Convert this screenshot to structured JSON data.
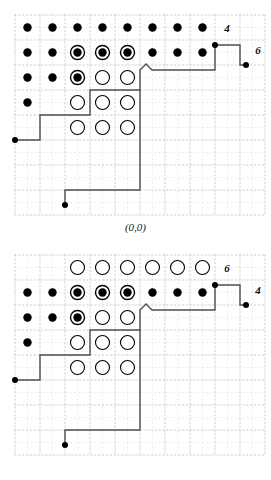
{
  "figures": [
    {
      "id": "figure-top",
      "caption": "(0,0)",
      "vertical_label": "4",
      "horizontal_label": "6",
      "grid": {
        "cols": 10,
        "rows": 8,
        "cell": 25,
        "origin_x": 15,
        "origin_y": 15,
        "minor_step": 12.5,
        "minor_color": "#d9d9e6",
        "major_color": "#c9c9d6"
      },
      "particles": [
        {
          "row": 0,
          "col": 0,
          "type": "filled"
        },
        {
          "row": 0,
          "col": 1,
          "type": "filled"
        },
        {
          "row": 0,
          "col": 2,
          "type": "filled"
        },
        {
          "row": 0,
          "col": 3,
          "type": "filled"
        },
        {
          "row": 0,
          "col": 4,
          "type": "filled"
        },
        {
          "row": 0,
          "col": 5,
          "type": "filled"
        },
        {
          "row": 0,
          "col": 6,
          "type": "filled"
        },
        {
          "row": 0,
          "col": 7,
          "type": "filled"
        },
        {
          "row": 1,
          "col": 0,
          "type": "filled"
        },
        {
          "row": 1,
          "col": 1,
          "type": "filled"
        },
        {
          "row": 1,
          "col": 2,
          "type": "ringed"
        },
        {
          "row": 1,
          "col": 3,
          "type": "ringed"
        },
        {
          "row": 1,
          "col": 4,
          "type": "ringed"
        },
        {
          "row": 1,
          "col": 5,
          "type": "filled"
        },
        {
          "row": 1,
          "col": 6,
          "type": "filled"
        },
        {
          "row": 1,
          "col": 7,
          "type": "filled"
        },
        {
          "row": 2,
          "col": 0,
          "type": "filled"
        },
        {
          "row": 2,
          "col": 1,
          "type": "filled"
        },
        {
          "row": 2,
          "col": 2,
          "type": "ringed"
        },
        {
          "row": 2,
          "col": 3,
          "type": "open"
        },
        {
          "row": 2,
          "col": 4,
          "type": "open"
        },
        {
          "row": 3,
          "col": 0,
          "type": "filled"
        },
        {
          "row": 3,
          "col": 2,
          "type": "open"
        },
        {
          "row": 3,
          "col": 3,
          "type": "open"
        },
        {
          "row": 3,
          "col": 4,
          "type": "open"
        },
        {
          "row": 4,
          "col": 2,
          "type": "open"
        },
        {
          "row": 4,
          "col": 3,
          "type": "open"
        },
        {
          "row": 4,
          "col": 4,
          "type": "open"
        }
      ],
      "path": "M 15,140 L 40,140 L 40,115 L 90,115 L 90,90 L 140,90 L 140,70 L 146,64 L 152,70 L 215,70 L 215,45 L 240,45 L 240,65 L 246,65",
      "path_points": [
        {
          "x": 15,
          "y": 140,
          "marker": "dot"
        },
        {
          "x": 215,
          "y": 45,
          "marker": "none"
        },
        {
          "x": 246,
          "y": 65,
          "marker": "dot"
        }
      ],
      "path_lower": "M 140,90 L 140,190 L 65,190 L 65,205",
      "endpoints": [
        {
          "x": 15,
          "y": 140
        },
        {
          "x": 65,
          "y": 205
        },
        {
          "x": 215,
          "y": 45
        },
        {
          "x": 246,
          "y": 65
        }
      ],
      "label_positions": {
        "vertical": {
          "x": 227,
          "y": 32
        },
        "horizontal": {
          "x": 258,
          "y": 54
        }
      }
    },
    {
      "id": "figure-bottom",
      "caption": "(0,0)",
      "vertical_label": "6",
      "horizontal_label": "4",
      "grid": {
        "cols": 10,
        "rows": 8,
        "cell": 25,
        "origin_x": 15,
        "origin_y": 15,
        "minor_step": 12.5,
        "minor_color": "#d9d9e6",
        "major_color": "#c9c9d6"
      },
      "particles": [
        {
          "row": 0,
          "col": 2,
          "type": "open"
        },
        {
          "row": 0,
          "col": 3,
          "type": "open"
        },
        {
          "row": 0,
          "col": 4,
          "type": "open"
        },
        {
          "row": 0,
          "col": 5,
          "type": "open"
        },
        {
          "row": 0,
          "col": 6,
          "type": "open"
        },
        {
          "row": 0,
          "col": 7,
          "type": "open"
        },
        {
          "row": 1,
          "col": 0,
          "type": "filled"
        },
        {
          "row": 1,
          "col": 1,
          "type": "filled"
        },
        {
          "row": 1,
          "col": 2,
          "type": "ringed"
        },
        {
          "row": 1,
          "col": 3,
          "type": "ringed"
        },
        {
          "row": 1,
          "col": 4,
          "type": "ringed"
        },
        {
          "row": 1,
          "col": 5,
          "type": "filled"
        },
        {
          "row": 1,
          "col": 6,
          "type": "filled"
        },
        {
          "row": 1,
          "col": 7,
          "type": "filled"
        },
        {
          "row": 2,
          "col": 0,
          "type": "filled"
        },
        {
          "row": 2,
          "col": 1,
          "type": "filled"
        },
        {
          "row": 2,
          "col": 2,
          "type": "ringed"
        },
        {
          "row": 2,
          "col": 3,
          "type": "open"
        },
        {
          "row": 2,
          "col": 4,
          "type": "open"
        },
        {
          "row": 3,
          "col": 0,
          "type": "filled"
        },
        {
          "row": 3,
          "col": 2,
          "type": "open"
        },
        {
          "row": 3,
          "col": 3,
          "type": "open"
        },
        {
          "row": 3,
          "col": 4,
          "type": "open"
        },
        {
          "row": 4,
          "col": 2,
          "type": "open"
        },
        {
          "row": 4,
          "col": 3,
          "type": "open"
        },
        {
          "row": 4,
          "col": 4,
          "type": "open"
        }
      ],
      "path": "M 15,140 L 40,140 L 40,115 L 90,115 L 90,90 L 140,90 L 140,70 L 146,64 L 152,70 L 215,70 L 215,45 L 240,45 L 240,65 L 246,65",
      "path_lower": "M 140,90 L 140,190 L 65,190 L 65,205",
      "endpoints": [
        {
          "x": 15,
          "y": 140
        },
        {
          "x": 65,
          "y": 205
        },
        {
          "x": 215,
          "y": 45
        },
        {
          "x": 246,
          "y": 65
        }
      ],
      "label_positions": {
        "vertical": {
          "x": 227,
          "y": 32
        },
        "horizontal": {
          "x": 258,
          "y": 54
        }
      }
    }
  ],
  "style": {
    "dot_radius": 4.2,
    "ring_radius": 7.0,
    "open_radius": 7.0,
    "endpoint_radius": 3.0,
    "path_color": "#4d4d4d",
    "path_width": 1.4,
    "ink": "#000000"
  }
}
